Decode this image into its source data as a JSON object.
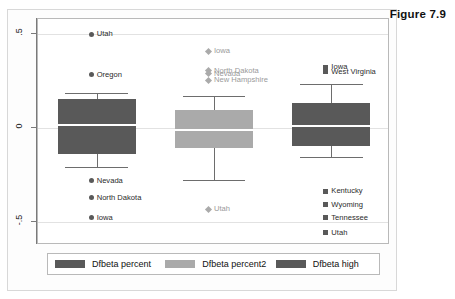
{
  "figure": {
    "title": "Figure 7.9"
  },
  "chart_data": {
    "type": "box",
    "title": "Figure 7.9",
    "xlabel": "",
    "ylabel": "",
    "ylim": [
      -0.62,
      0.58
    ],
    "grid": true,
    "y_ticks": [
      {
        "value": 0.5,
        "label": ".5"
      },
      {
        "value": 0,
        "label": "0"
      },
      {
        "value": -0.5,
        "label": "-.5"
      }
    ],
    "legend_position": "bottom",
    "series": [
      {
        "name": "Dfbeta percent",
        "color": "#595959",
        "marker": "circle",
        "whisker_high": 0.185,
        "q3": 0.155,
        "median": 0.015,
        "q1": -0.135,
        "whisker_low": -0.205,
        "outliers_high": [
          {
            "label": "Utah",
            "value": 0.5
          },
          {
            "label": "Oregon",
            "value": 0.285
          }
        ],
        "outliers_low": [
          {
            "label": "Nevada",
            "value": -0.28
          },
          {
            "label": "North Dakota",
            "value": -0.37
          },
          {
            "label": "Iowa",
            "value": -0.475
          }
        ]
      },
      {
        "name": "Dfbeta percent2",
        "color": "#aaaaaa",
        "marker": "diamond",
        "whisker_high": 0.17,
        "q3": 0.095,
        "median": -0.01,
        "q1": -0.105,
        "whisker_low": -0.275,
        "outliers_high": [
          {
            "label": "Iowa",
            "value": 0.41
          },
          {
            "label": "North Dakota",
            "value": 0.305
          },
          {
            "label": "Nevada",
            "value": 0.29
          },
          {
            "label": "New Hampshire",
            "value": 0.255
          }
        ],
        "outliers_low": [
          {
            "label": "Utah",
            "value": -0.43
          }
        ]
      },
      {
        "name": "Dfbeta high",
        "color": "#595959",
        "marker": "square",
        "whisker_high": 0.235,
        "q3": 0.135,
        "median": 0.01,
        "q1": -0.095,
        "whisker_low": -0.155,
        "outliers_high": [
          {
            "label": "Iowa",
            "value": 0.325
          },
          {
            "label": "West Virginia",
            "value": 0.3
          }
        ],
        "outliers_low": [
          {
            "label": "Kentucky",
            "value": -0.335
          },
          {
            "label": "Wyoming",
            "value": -0.405
          },
          {
            "label": "Tennessee",
            "value": -0.475
          },
          {
            "label": "Utah",
            "value": -0.555
          }
        ]
      }
    ]
  },
  "legend": {
    "items": [
      {
        "label": "Dfbeta percent",
        "color": "#595959"
      },
      {
        "label": "Dfbeta percent2",
        "color": "#aaaaaa"
      },
      {
        "label": "Dfbeta high",
        "color": "#595959"
      }
    ]
  }
}
